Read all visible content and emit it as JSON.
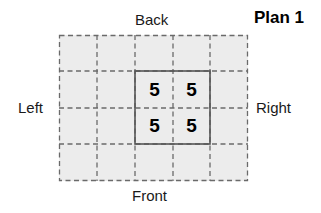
{
  "title": "Plan 1",
  "labels": {
    "back": "Back",
    "front": "Front",
    "left": "Left",
    "right": "Right"
  },
  "grid": {
    "columns": 5,
    "rows": 4,
    "highlighted_region": {
      "col_start": 2,
      "row_start": 1,
      "cols": 2,
      "rows": 2
    },
    "cells": [
      {
        "row": 1,
        "col": 2,
        "value": "5"
      },
      {
        "row": 1,
        "col": 3,
        "value": "5"
      },
      {
        "row": 2,
        "col": 2,
        "value": "5"
      },
      {
        "row": 2,
        "col": 3,
        "value": "5"
      }
    ]
  },
  "colors": {
    "cell_fill": "#ececec",
    "dashed_line": "#666666",
    "solid_line": "#555555"
  }
}
